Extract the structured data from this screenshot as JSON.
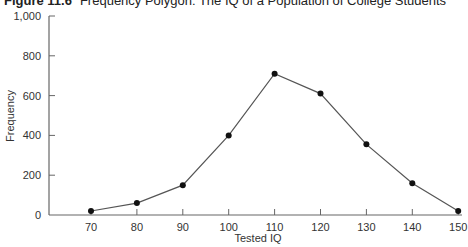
{
  "figure": {
    "number": "Figure 11.6",
    "caption": "Frequency Polygon: The IQ of a Population of College Students"
  },
  "chart_data": {
    "type": "line",
    "xlabel": "Tested IQ",
    "ylabel": "Frequency",
    "x": [
      70,
      80,
      90,
      100,
      110,
      120,
      130,
      140,
      150
    ],
    "series": [
      {
        "name": "Frequency",
        "values": [
          20,
          60,
          150,
          400,
          710,
          610,
          355,
          160,
          20
        ]
      }
    ],
    "x_ticks": [
      "70",
      "80",
      "90",
      "100",
      "110",
      "120",
      "130",
      "140",
      "150"
    ],
    "y_ticks": [
      "0",
      "200",
      "400",
      "600",
      "800",
      "1,000"
    ],
    "ylim": [
      0,
      1000
    ],
    "xlim": [
      60,
      150
    ],
    "grid": false,
    "legend": null,
    "markers": "filled-circle",
    "line_color": "#555555",
    "marker_color": "#111111"
  }
}
